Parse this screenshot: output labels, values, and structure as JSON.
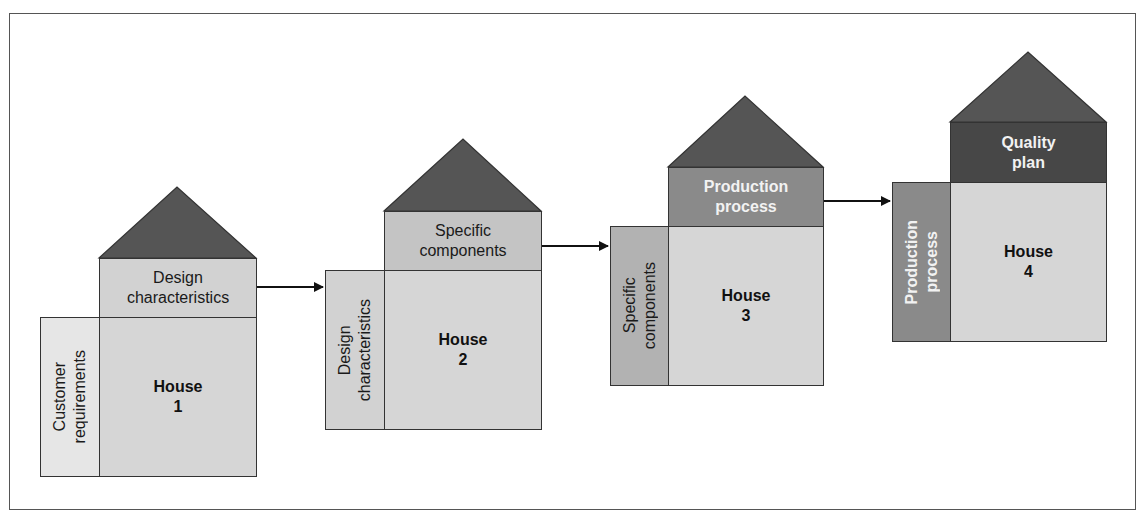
{
  "figure": {
    "colors": {
      "roof": "#555555",
      "main": "#d6d6d6",
      "border": "#333333",
      "arrow": "#111111"
    },
    "houses": [
      {
        "id": 1,
        "title": "House\n1",
        "top_label": "Design\ncharacteristics",
        "left_label": "Customer\nrequirements",
        "top_color": "#d2d2d2",
        "left_color": "#e6e6e6"
      },
      {
        "id": 2,
        "title": "House\n2",
        "top_label": "Specific\ncomponents",
        "left_label": "Design\ncharacteristics",
        "top_color": "#c4c4c4",
        "left_color": "#d2d2d2"
      },
      {
        "id": 3,
        "title": "House\n3",
        "top_label": "Production\nprocess",
        "left_label": "Specific\ncomponents",
        "top_color": "#8a8a8a",
        "left_color": "#b2b2b2"
      },
      {
        "id": 4,
        "title": "House\n4",
        "top_label": "Quality\nplan",
        "left_label": "Production\nprocess",
        "top_color": "#474747",
        "left_color": "#8a8a8a"
      }
    ],
    "arrows": [
      {
        "from": "House 1",
        "to": "House 2"
      },
      {
        "from": "House 2",
        "to": "House 3"
      },
      {
        "from": "House 3",
        "to": "House 4"
      }
    ]
  }
}
